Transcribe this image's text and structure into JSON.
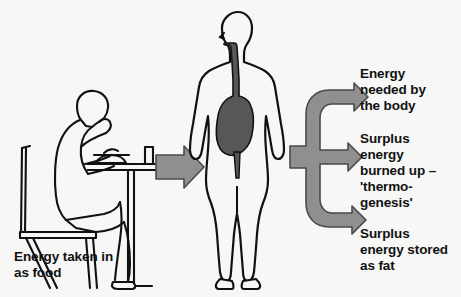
{
  "figure": {
    "background_color": "#f7f7f5",
    "ink_color": "#111111",
    "arrow_fill": "#8f8f8f",
    "arrow_stroke": "#4a4a4a",
    "organ_fill": "#575757"
  },
  "captions": {
    "food": "Energy taken in\nas food",
    "needed": "Energy\nneeded by\nthe body",
    "surplus_burned": "Surplus\nenergy\nburned up –\n'thermo-\ngenesis'",
    "surplus_fat": "Surplus\nenergy stored\nas fat"
  },
  "elements": {
    "eating_person": "person-eating-at-table",
    "table": "dining-table",
    "chair": "chair",
    "bowl": "bowl-of-food",
    "glass": "drinking-glass",
    "standing_body": "standing-human-body-outline",
    "digestive_tract": "esophagus-and-stomach",
    "intake_arrow": "right-pointing-arrow",
    "branch_brace": "three-way-branching-arrow"
  }
}
